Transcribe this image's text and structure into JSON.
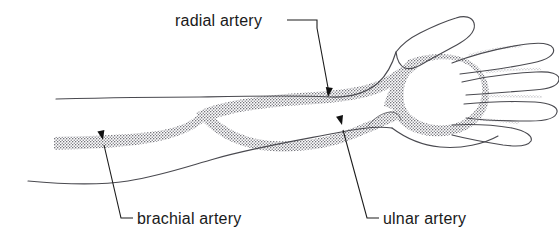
{
  "figure": {
    "kind": "anatomical-line-drawing",
    "background_color": "#ffffff",
    "outline_color": "#4a4a50",
    "artery_texture": "stippled",
    "artery_color": "#77777e",
    "leader_color": "#1d1d1d",
    "text_color": "#1a1a1a"
  },
  "labels": [
    {
      "id": "radial",
      "text": "radial artery",
      "text_x": 175,
      "text_y": 26,
      "anchor": "start",
      "leader_path": "M 287 20 L 317 20 L 317 28 L 329 93",
      "arrow_x": 328,
      "arrow_y": 97,
      "arrow_rotation": 8
    },
    {
      "id": "brachial",
      "text": "brachial artery",
      "text_x": 137,
      "text_y": 224,
      "anchor": "start",
      "leader_path": "M 133 218 L 121 218 L 104 145",
      "arrow_x": 103,
      "arrow_y": 140,
      "arrow_rotation": -13
    },
    {
      "id": "ulnar",
      "text": "ulnar artery",
      "text_x": 383,
      "text_y": 224,
      "anchor": "start",
      "leader_path": "M 379 218 L 367 218 L 343 130",
      "arrow_x": 342,
      "arrow_y": 125,
      "arrow_rotation": -15
    }
  ],
  "arteries": [
    {
      "id": "brachial-trunk",
      "name": "brachial artery",
      "label_ref": "brachial"
    },
    {
      "id": "radial-branch",
      "name": "radial artery",
      "label_ref": "radial"
    },
    {
      "id": "ulnar-branch",
      "name": "ulnar artery",
      "label_ref": "ulnar"
    },
    {
      "id": "palmar-arch",
      "name": "palmar arch",
      "label_ref": null
    },
    {
      "id": "digital-1",
      "name": "digital branch 1",
      "label_ref": null
    },
    {
      "id": "digital-2",
      "name": "digital branch 2",
      "label_ref": null
    },
    {
      "id": "digital-3",
      "name": "digital branch 3",
      "label_ref": null
    },
    {
      "id": "digital-4",
      "name": "digital branch 4",
      "label_ref": null
    }
  ],
  "anatomy_outlines": [
    {
      "id": "arm-upper-edge",
      "name": "upper arm contour"
    },
    {
      "id": "arm-lower-edge",
      "name": "lower arm contour"
    },
    {
      "id": "thumb",
      "name": "thumb outline"
    },
    {
      "id": "finger-index",
      "name": "index finger outline"
    },
    {
      "id": "finger-middle",
      "name": "middle finger outline"
    },
    {
      "id": "finger-ring",
      "name": "ring finger outline"
    },
    {
      "id": "finger-little",
      "name": "little finger outline"
    },
    {
      "id": "hand-palm-edge",
      "name": "palm lower contour"
    },
    {
      "id": "thenar-crease",
      "name": "thenar crease"
    }
  ]
}
